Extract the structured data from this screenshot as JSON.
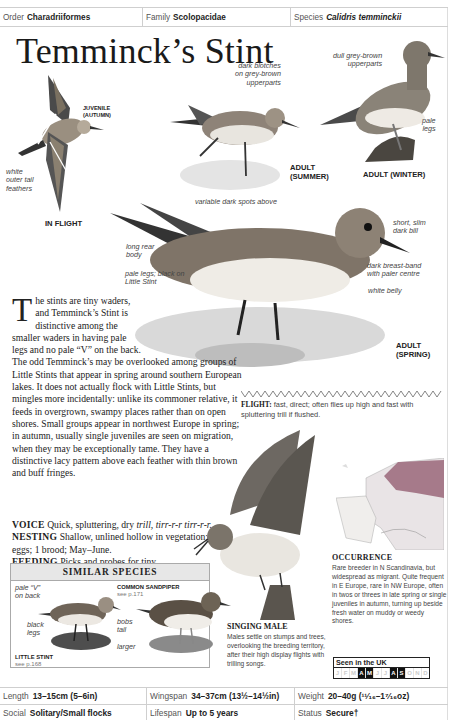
{
  "taxonomy": {
    "order_label": "Order",
    "order_value": "Charadriiformes",
    "family_label": "Family",
    "family_value": "Scolopacidae",
    "species_label": "Species",
    "species_value": "Calidris temminckii"
  },
  "title": "Temminck’s Stint",
  "illustrations": {
    "in_flight": {
      "caption": "IN FLIGHT",
      "sub_caption": [
        "JUVENILE",
        "(AUTUMN)"
      ],
      "annotations": [
        "white",
        "outer tail",
        "feathers"
      ]
    },
    "adult_summer": {
      "caption": [
        "ADULT",
        "(SUMMER)"
      ],
      "annotations": [
        "dark blotches",
        "on grey-brown",
        "upperparts"
      ]
    },
    "adult_winter": {
      "caption": "ADULT (WINTER)",
      "annotations_top": [
        "dull grey-brown",
        "upperparts"
      ],
      "annotations_legs": [
        "pale",
        "legs"
      ]
    },
    "adult_spring": {
      "caption": [
        "ADULT",
        "(SPRING)"
      ],
      "annotations": {
        "spots": "variable dark spots above",
        "bill": [
          "short, slim",
          "dark bill"
        ],
        "rear": [
          "long rear",
          "body"
        ],
        "breast": [
          "dark breast-band",
          "with paler centre"
        ],
        "legs": [
          "pale legs; black on",
          "Little Stint"
        ],
        "belly": "white belly"
      }
    },
    "singing_male": {
      "title": "SINGING MALE",
      "text": "Males settle on stumps and trees, overlooking the breeding territory, after their high display flights with trilling songs."
    }
  },
  "body": {
    "dropcap": "T",
    "intro": "he stints are tiny waders, and Temminck’s Stint is distinctive among the smaller waders in having pale legs and no pale “V” on the back. The odd Temminck’s may be overlooked among groups of Little Stints that appear in spring around southern European lakes. It does not actually flock with Little Stints, but mingles more incidentally: unlike its commoner relative, it feeds in overgrown, swampy places rather than on open shores. Small groups appear in northwest Europe in spring; in autumn, usually single juveniles are seen on migration, when they may be exceptionally tame. They have a distinctive lacy pattern above each feather with thin brown and buff fringes.",
    "voice_label": "VOICE",
    "voice_text_a": "Quick, spluttering, dry ",
    "voice_text_b": "trill, tirr-r-r tirr-r-r.",
    "nesting_label": "NESTING",
    "nesting_text": "Shallow, unlined hollow in vegetation; 4 eggs; 1 brood; May–June.",
    "feeding_label": "FEEDING",
    "feeding_text": "Picks and probes for tiny invertebrates among short vegetation or on sticky, wet mud."
  },
  "flight": {
    "label": "FLIGHT:",
    "text": " fast, direct; often flies up high and fast with spluttering trill if flushed."
  },
  "similar_species": {
    "title": "SIMILAR SPECIES",
    "little_stint": {
      "name": "LITTLE STINT",
      "ref": "see p.168",
      "annotations": {
        "v": [
          "pale “V”",
          "on back"
        ],
        "legs": [
          "black",
          "legs"
        ]
      }
    },
    "common_sandpiper": {
      "name": "COMMON SANDPIPER",
      "ref": "see p.171",
      "annotations": {
        "tail": [
          "bobs",
          "tail"
        ],
        "size": "larger"
      }
    }
  },
  "occurrence": {
    "title": "OCCURRENCE",
    "text": "Rare breeder in N Scandinavia, but widespread as migrant. Quite frequent in E Europe, rare in NW Europe, often in twos or threes in late spring or single juveniles in autumn, turning up beside fresh water on muddy or weedy shores."
  },
  "seen_in_uk": {
    "label": "Seen in the UK",
    "months": [
      {
        "m": "J",
        "on": false
      },
      {
        "m": "F",
        "on": false
      },
      {
        "m": "M",
        "on": false
      },
      {
        "m": "A",
        "on": true
      },
      {
        "m": "M",
        "on": true
      },
      {
        "m": "J",
        "on": false
      },
      {
        "m": "J",
        "on": false
      },
      {
        "m": "A",
        "on": true
      },
      {
        "m": "S",
        "on": true
      },
      {
        "m": "O",
        "on": false
      },
      {
        "m": "N",
        "on": false
      },
      {
        "m": "D",
        "on": false
      }
    ]
  },
  "footer": {
    "row1": [
      {
        "label": "Length",
        "value": "13–15cm (5–6in)"
      },
      {
        "label": "Wingspan",
        "value": "34–37cm (13½–14½in)"
      },
      {
        "label": "Weight",
        "value": "20–40g (¹¹⁄₁₆–1⁷⁄₁₆oz)"
      }
    ],
    "row2": [
      {
        "label": "Social",
        "value": "Solitary/Small flocks"
      },
      {
        "label": "Lifespan",
        "value": "Up to 5 years"
      },
      {
        "label": "Status",
        "value": "Secure†"
      }
    ]
  },
  "colors": {
    "rule": "#cfcfcf",
    "header_fill": "#e7e7e7",
    "range_map": "#a67a8a",
    "text": "#222222"
  }
}
